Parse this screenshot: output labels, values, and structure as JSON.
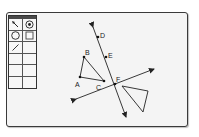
{
  "window": {
    "canvas_background": "#f4f4f4",
    "border_color": "#3a3a3a"
  },
  "toolbar": {
    "tools": [
      {
        "name": "pointer-tool",
        "icon": "arrow-pointer-icon",
        "selected": false
      },
      {
        "name": "point-tool",
        "icon": "point-in-circle-icon",
        "selected": true
      },
      {
        "name": "circle-tool",
        "icon": "circle-icon",
        "selected": false
      },
      {
        "name": "polygon-tool",
        "icon": "square-icon",
        "selected": false
      },
      {
        "name": "line-tool",
        "icon": "line-segment-icon",
        "selected": false
      },
      {
        "name": "empty-slot",
        "icon": "",
        "selected": false
      },
      {
        "name": "empty-slot",
        "icon": "",
        "selected": false
      },
      {
        "name": "empty-slot",
        "icon": "",
        "selected": false
      },
      {
        "name": "empty-slot",
        "icon": "",
        "selected": false
      },
      {
        "name": "empty-slot",
        "icon": "",
        "selected": false
      },
      {
        "name": "empty-slot",
        "icon": "",
        "selected": false
      },
      {
        "name": "empty-slot",
        "icon": "",
        "selected": false
      }
    ]
  },
  "figure": {
    "points": {
      "A": {
        "label": "A",
        "x": 80,
        "y": 77
      },
      "B": {
        "label": "B",
        "x": 84,
        "y": 57
      },
      "C": {
        "label": "C",
        "x": 104,
        "y": 81
      },
      "D": {
        "label": "D",
        "x": 98,
        "y": 37
      },
      "E": {
        "label": "E",
        "x": 106,
        "y": 57
      },
      "F": {
        "label": "F",
        "x": 115,
        "y": 84
      }
    },
    "labels": {
      "A": "A",
      "B": "B",
      "C": "C",
      "D": "D",
      "E": "E",
      "F": "F"
    },
    "line_DEF": {
      "x1": 93,
      "y1": 27,
      "x2": 126,
      "y2": 117
    },
    "line_through_F": {
      "x1": 76,
      "y1": 99,
      "x2": 154,
      "y2": 69
    },
    "triangle_ABC": [
      [
        80,
        77
      ],
      [
        84,
        57
      ],
      [
        104,
        81
      ]
    ],
    "triangle_unlabeled": [
      [
        122,
        86
      ],
      [
        148,
        91
      ],
      [
        143,
        112
      ]
    ]
  }
}
